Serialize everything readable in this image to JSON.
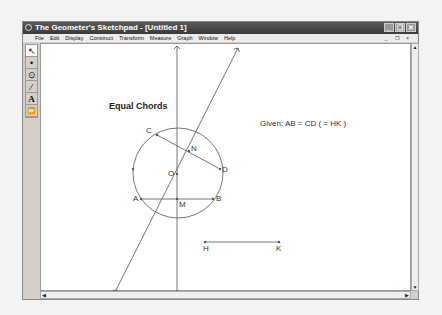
{
  "window": {
    "title": "The Geometer's Sketchpad - [Untitled 1]",
    "controls": {
      "minimize": "_",
      "restore": "❐",
      "close": "✕"
    }
  },
  "menubar": {
    "items": [
      "File",
      "Edit",
      "Display",
      "Construct",
      "Transform",
      "Measure",
      "Graph",
      "Window",
      "Help"
    ],
    "doc_controls": "_ ❐ ×"
  },
  "toolbox": {
    "tools": [
      {
        "name": "arrow-tool",
        "glyph": "↖",
        "selected": true
      },
      {
        "name": "point-tool",
        "glyph": "•"
      },
      {
        "name": "compass-tool",
        "glyph": "⊙"
      },
      {
        "name": "straightedge-tool",
        "glyph": "⁄"
      },
      {
        "name": "text-tool",
        "glyph": "A"
      },
      {
        "name": "custom-tool",
        "glyph": "⏩"
      }
    ]
  },
  "sketch": {
    "title": "Equal Chords",
    "given": "Given: AB = CD ( = HK )",
    "points": {
      "A": "A",
      "B": "B",
      "C": "C",
      "D": "D",
      "M": "M",
      "N": "N",
      "O": "O",
      "H": "H",
      "K": "K"
    }
  },
  "scrollbars": {
    "up": "▲",
    "down": "▼",
    "left": "◀",
    "right": "▶"
  }
}
